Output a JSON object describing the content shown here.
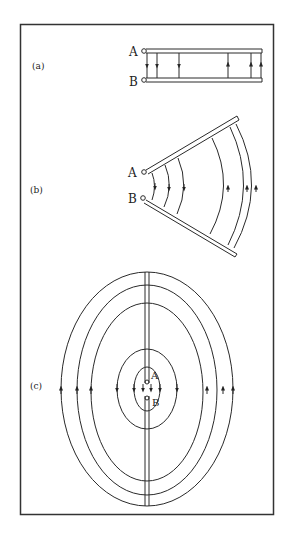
{
  "figure": {
    "panels": [
      {
        "id": "a",
        "label": "(a)",
        "terminal_top": "A",
        "terminal_bottom": "B",
        "description": "Parallel-wire transmission line with field lines"
      },
      {
        "id": "b",
        "label": "(b)",
        "terminal_top": "A",
        "terminal_bottom": "B",
        "description": "Diverging (V-shaped) wires with curved field lines"
      },
      {
        "id": "c",
        "label": "(c)",
        "terminal_top": "A",
        "terminal_bottom": "B",
        "description": "Collinear wires with elliptical field lines"
      }
    ],
    "colors": {
      "line": "#2a2a2a",
      "background": "#ffffff",
      "frame": "#333333"
    }
  }
}
